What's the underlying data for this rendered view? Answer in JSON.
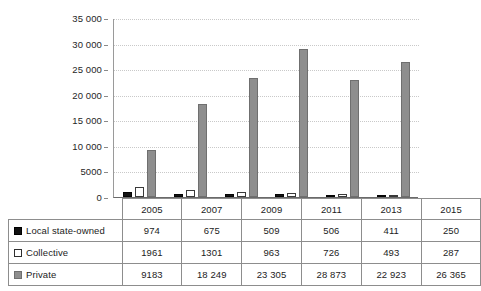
{
  "chart_data": {
    "type": "bar",
    "title": "",
    "xlabel": "",
    "ylabel": "",
    "ylim": [
      0,
      35000
    ],
    "ytick_labels": [
      "35 000",
      "30 000",
      "25 000",
      "20 000",
      "15 000",
      "10 000",
      "5000",
      "0"
    ],
    "ytick_values": [
      35000,
      30000,
      25000,
      20000,
      15000,
      10000,
      5000,
      0
    ],
    "grid": true,
    "legend_position": "table-row-headers",
    "categories": [
      "2005",
      "2007",
      "2009",
      "2011",
      "2013",
      "2015"
    ],
    "series": [
      {
        "name": "Local state-owned",
        "marker": "black-filled-square",
        "color": "#131313",
        "values": [
          974,
          675,
          509,
          506,
          411,
          250
        ],
        "value_labels": [
          "974",
          "675",
          "509",
          "506",
          "411",
          "250"
        ]
      },
      {
        "name": "Collective",
        "marker": "white-outlined-square",
        "color": "#ffffff",
        "values": [
          1961,
          1301,
          963,
          726,
          493,
          287
        ],
        "value_labels": [
          "1961",
          "1301",
          "963",
          "726",
          "493",
          "287"
        ]
      },
      {
        "name": "Private",
        "marker": "gray-filled-square",
        "color": "#8e8e8e",
        "values": [
          9183,
          18249,
          23305,
          28873,
          22923,
          26365
        ],
        "value_labels": [
          "9183",
          "18 249",
          "23 305",
          "28 873",
          "22 923",
          "26 365"
        ]
      }
    ]
  }
}
